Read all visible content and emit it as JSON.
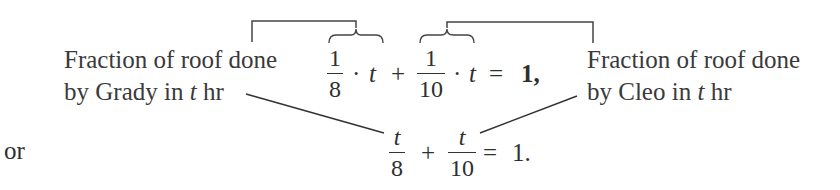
{
  "annotations": {
    "left": {
      "line1": "Fraction of roof done",
      "line2_prefix": "by Grady in ",
      "line2_var": "t",
      "line2_suffix": " hr"
    },
    "right": {
      "line1": "Fraction of roof done",
      "line2_prefix": "by Cleo in ",
      "line2_var": "t",
      "line2_suffix": " hr"
    }
  },
  "equation1": {
    "term1": {
      "numerator": "1",
      "denominator": "8"
    },
    "dot1": "·",
    "var1": "t",
    "plus": "+",
    "term2": {
      "numerator": "1",
      "denominator": "10"
    },
    "dot2": "·",
    "var2": "t",
    "equals": "=",
    "rhs": "1,"
  },
  "connector": "or",
  "equation2": {
    "term1": {
      "numerator": "t",
      "denominator": "8"
    },
    "plus": "+",
    "term2": {
      "numerator": "t",
      "denominator": "10"
    },
    "equals": "=",
    "rhs": "1."
  }
}
